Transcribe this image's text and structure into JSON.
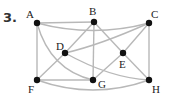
{
  "problem_number": "3.",
  "graph": {
    "vertices": [
      {
        "id": "A",
        "x": 37,
        "y": 23,
        "lx": 26,
        "ly": 18
      },
      {
        "id": "B",
        "x": 94,
        "y": 22,
        "lx": 89,
        "ly": 15
      },
      {
        "id": "C",
        "x": 149,
        "y": 23,
        "lx": 151,
        "ly": 18
      },
      {
        "id": "D",
        "x": 65,
        "y": 53,
        "lx": 56,
        "ly": 50
      },
      {
        "id": "E",
        "x": 123,
        "y": 53,
        "lx": 119,
        "ly": 68
      },
      {
        "id": "F",
        "x": 37,
        "y": 80,
        "lx": 28,
        "ly": 93
      },
      {
        "id": "G",
        "x": 93,
        "y": 80,
        "lx": 98,
        "ly": 88
      },
      {
        "id": "H",
        "x": 149,
        "y": 80,
        "lx": 152,
        "ly": 93
      }
    ],
    "edges": [
      [
        "A",
        "B"
      ],
      [
        "A",
        "C"
      ],
      [
        "A",
        "F"
      ],
      [
        "A",
        "G"
      ],
      [
        "B",
        "D"
      ],
      [
        "B",
        "G"
      ],
      [
        "B",
        "E"
      ],
      [
        "E",
        "H"
      ],
      [
        "C",
        "D"
      ],
      [
        "C",
        "E"
      ],
      [
        "E",
        "G"
      ],
      [
        "C",
        "H"
      ],
      [
        "D",
        "F"
      ],
      [
        "D",
        "H"
      ],
      [
        "F",
        "G"
      ],
      [
        "F",
        "H"
      ]
    ],
    "edge_color": "#b8b8b8",
    "vertex_color": "#111111"
  }
}
